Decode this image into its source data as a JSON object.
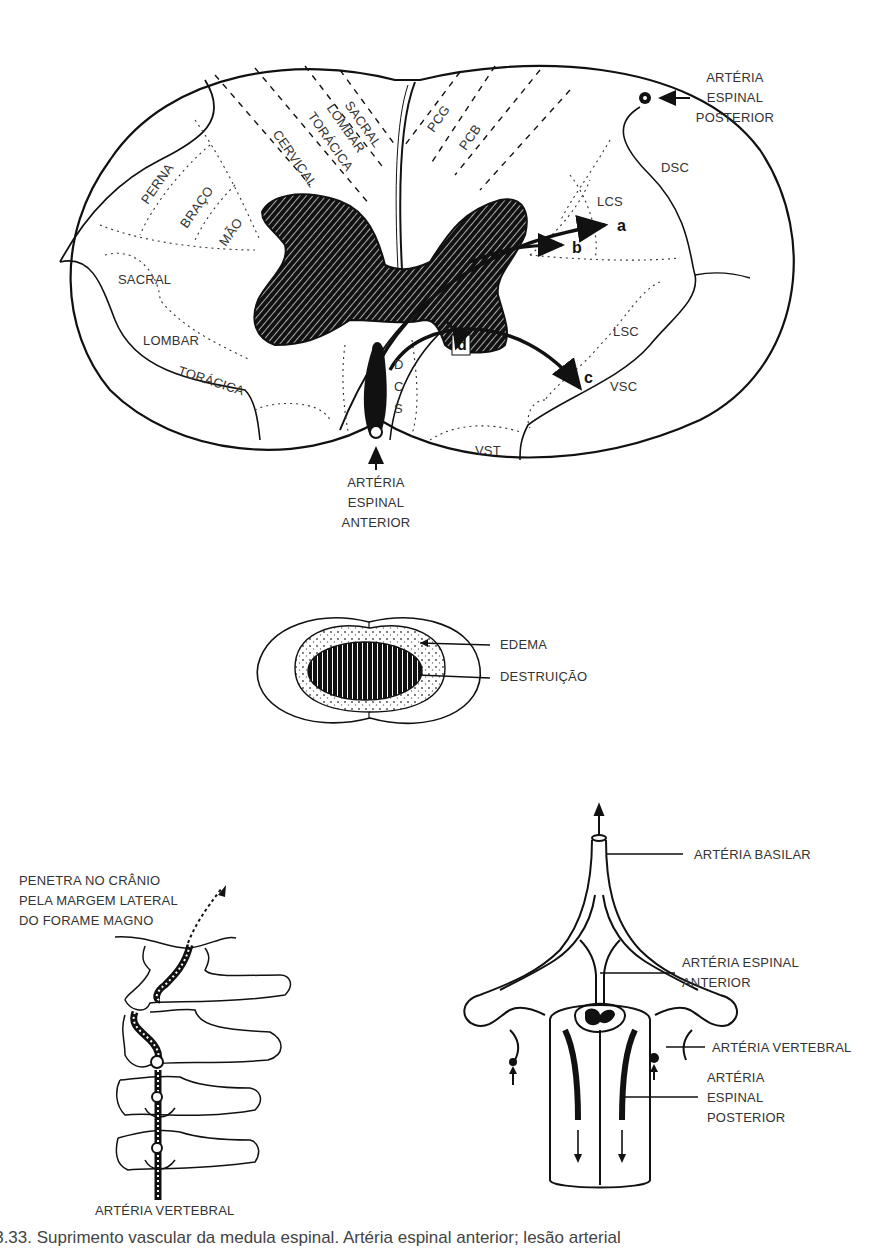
{
  "cross_section": {
    "left_labels": {
      "posterior_column": [
        "SACRAL",
        "LOMBAR",
        "TORÁCICA",
        "CERVICAL"
      ],
      "corticospinal_somatotopy": [
        "PERNA",
        "BRAÇO",
        "MÃO"
      ],
      "spinothalamic_somatotopy": [
        "SACRAL",
        "LOMBAR",
        "TORÁCICA"
      ]
    },
    "right_labels": {
      "PCG": "PCG",
      "PCB": "PCB",
      "DSC": "DSC",
      "LCS": "LCS",
      "LSC": "LSC",
      "VSC": "VSC",
      "VST": "VST",
      "DCS": [
        "D",
        "C",
        "S"
      ]
    },
    "arrows": [
      "a",
      "b",
      "c",
      "d"
    ],
    "posterior_artery_label": [
      "ARTÉRIA",
      "ESPINAL",
      "POSTERIOR"
    ],
    "anterior_artery_label": [
      "ARTÉRIA",
      "ESPINAL",
      "ANTERIOR"
    ]
  },
  "lesion": {
    "edema": "EDEMA",
    "destruction": "DESTRUIÇÃO"
  },
  "vertebral_diagram": {
    "entry_note": [
      "PENETRA NO CRÂNIO",
      "PELA MARGEM LATERAL",
      "DO FORAME MAGNO"
    ],
    "bottom_label": "ARTÉRIA VERTEBRAL"
  },
  "arterial_supply": {
    "basilar": "ARTÉRIA BASILAR",
    "anterior_spinal": [
      "ARTÉRIA ESPINAL",
      "ANTERIOR"
    ],
    "vertebral": "ARTÉRIA VERTEBRAL",
    "posterior_spinal": [
      "ARTÉRIA",
      "ESPINAL",
      "POSTERIOR"
    ]
  },
  "caption": "a 3.33. Suprimento vascular da medula espinal. Artéria espinal anterior; lesão arterial"
}
